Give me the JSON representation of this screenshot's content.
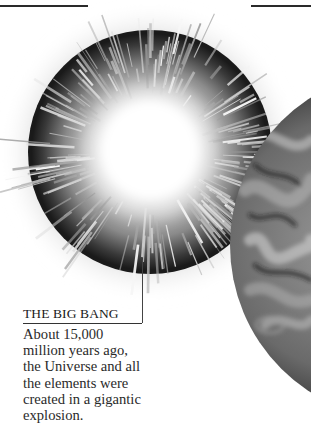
{
  "illustrations": {
    "explosion": {
      "name": "big-bang-explosion",
      "palette": {
        "core": "#ffffff",
        "ring": "#1c1c1c",
        "rays": "#9a9a9a"
      }
    },
    "planet": {
      "name": "early-planet-surface",
      "palette": {
        "dark": "#141414",
        "light": "#a8a8a8"
      }
    }
  },
  "caption": {
    "title": "THE BIG BANG",
    "lines": [
      "About 15,000",
      "million years ago,",
      "the Universe and all",
      "the elements were",
      "created in a gigantic",
      "explosion."
    ]
  }
}
